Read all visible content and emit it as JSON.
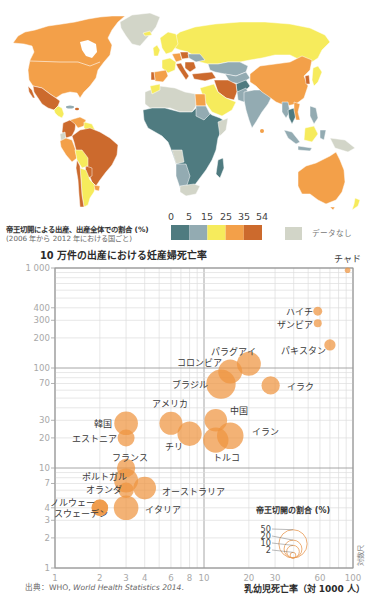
{
  "map": {
    "legend": {
      "title": "帝王切開による出産、出産全体での割合 (%)",
      "subtitle": "(2006 年から 2012 年における国ごと)",
      "breaks": [
        "0",
        "5",
        "15",
        "25",
        "35",
        "54"
      ],
      "bins": [
        {
          "range": "0–5",
          "color": "#4F7B80"
        },
        {
          "range": "5–15",
          "color": "#93ABB2"
        },
        {
          "range": "15–25",
          "color": "#F6EB5C"
        },
        {
          "range": "25–35",
          "color": "#F3A049"
        },
        {
          "range": "35–54",
          "color": "#CC6A2D"
        }
      ],
      "no_data": {
        "label": "データなし",
        "color": "#D2D5C8"
      }
    }
  },
  "chart_data": {
    "type": "scatter",
    "title": "10 万件の出産における妊産婦死亡率",
    "xlabel": "乳幼児死亡率（対 1000 人）",
    "ylabel": "10 万件の出産における妊産婦死亡率",
    "xscale": "log",
    "yscale": "log",
    "xlim": [
      1,
      100
    ],
    "ylim": [
      1,
      1000
    ],
    "grid": true,
    "scale_note": "対数尺",
    "bubble_color": "#EE9440",
    "x_ticks": [
      {
        "value": 1,
        "label": "1"
      },
      {
        "value": 2,
        "label": "2"
      },
      {
        "value": 3,
        "label": "3"
      },
      {
        "value": 4,
        "label": "4"
      },
      {
        "value": 6,
        "label": "6"
      },
      {
        "value": 8,
        "label": "8"
      },
      {
        "value": 10,
        "label": "10"
      },
      {
        "value": 20,
        "label": "20"
      },
      {
        "value": 30,
        "label": "30"
      },
      {
        "value": 60,
        "label": "60"
      },
      {
        "value": 100,
        "label": "100"
      }
    ],
    "y_ticks": [
      {
        "value": 1,
        "label": "1"
      },
      {
        "value": 2,
        "label": "2"
      },
      {
        "value": 3,
        "label": "3"
      },
      {
        "value": 4,
        "label": "4"
      },
      {
        "value": 7,
        "label": "7"
      },
      {
        "value": 10,
        "label": "10"
      },
      {
        "value": 20,
        "label": "20"
      },
      {
        "value": 30,
        "label": "30"
      },
      {
        "value": 70,
        "label": "70"
      },
      {
        "value": 100,
        "label": "100"
      },
      {
        "value": 200,
        "label": "200"
      },
      {
        "value": 300,
        "label": "300"
      },
      {
        "value": 400,
        "label": "400"
      },
      {
        "value": 1000,
        "label": "1 000"
      }
    ],
    "size_legend": {
      "title": "帝王切開の割合 (%)",
      "values": [
        50,
        20,
        10,
        2
      ],
      "labels": [
        "50",
        "20",
        "10",
        "2"
      ]
    },
    "points": [
      {
        "label": "チャド",
        "x": 92,
        "y": 950,
        "csection_pct": 2
      },
      {
        "label": "ハイチ",
        "x": 58,
        "y": 370,
        "csection_pct": 5
      },
      {
        "label": "ザンビア",
        "x": 58,
        "y": 280,
        "csection_pct": 4
      },
      {
        "label": "パキスタン",
        "x": 70,
        "y": 170,
        "csection_pct": 8
      },
      {
        "label": "パラグアイ",
        "x": 20,
        "y": 110,
        "csection_pct": 36
      },
      {
        "label": "コロンビア",
        "x": 15,
        "y": 92,
        "csection_pct": 36
      },
      {
        "label": "ブラジル",
        "x": 13,
        "y": 69,
        "csection_pct": 54
      },
      {
        "label": "イラク",
        "x": 28,
        "y": 67,
        "csection_pct": 21
      },
      {
        "label": "アメリカ",
        "x": 6,
        "y": 28,
        "csection_pct": 33
      },
      {
        "label": "中国",
        "x": 12,
        "y": 30,
        "csection_pct": 32
      },
      {
        "label": "イラン",
        "x": 15,
        "y": 21,
        "csection_pct": 44
      },
      {
        "label": "チリ",
        "x": 8,
        "y": 22,
        "csection_pct": 37
      },
      {
        "label": "トルコ",
        "x": 12,
        "y": 19,
        "csection_pct": 40
      },
      {
        "label": "韓国",
        "x": 3,
        "y": 28,
        "csection_pct": 35
      },
      {
        "label": "エストニア",
        "x": 3,
        "y": 20,
        "csection_pct": 18
      },
      {
        "label": "フランス",
        "x": 3,
        "y": 10,
        "csection_pct": 21
      },
      {
        "label": "ポルトガル",
        "x": 3,
        "y": 7.5,
        "csection_pct": 36
      },
      {
        "label": "オランダ",
        "x": 3,
        "y": 6,
        "csection_pct": 15
      },
      {
        "label": "オーストラリア",
        "x": 4,
        "y": 6.3,
        "csection_pct": 32
      },
      {
        "label": "イタリア",
        "x": 3,
        "y": 4,
        "csection_pct": 38
      },
      {
        "label": "ノルウェー",
        "x": 2,
        "y": 4,
        "csection_pct": 17
      },
      {
        "label": "スウェーデン",
        "x": 2,
        "y": 4,
        "csection_pct": 17
      }
    ]
  },
  "source": {
    "prefix": "出典：WHO, ",
    "title": "World Health Statistics 2014",
    "suffix": "."
  }
}
